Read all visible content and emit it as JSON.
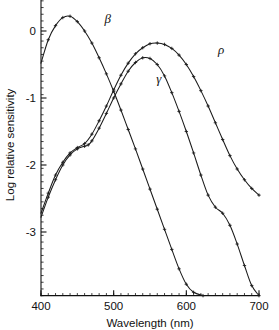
{
  "chart_data": {
    "type": "line",
    "title": "",
    "xlabel": "Wavelength  (nm)",
    "ylabel": "Log relative sensitivity",
    "xlim": [
      400,
      700
    ],
    "ylim": [
      -3.95,
      0.55
    ],
    "xticks": [
      400,
      500,
      600,
      700
    ],
    "xtick_labels": [
      "400",
      "500",
      "600",
      "700"
    ],
    "yticks": [
      0,
      -1,
      -2,
      -3
    ],
    "ytick_labels": [
      "0",
      "-1",
      "-2",
      "-3"
    ],
    "x_minor_tick_step": 10,
    "y_minor_tick_step": 0.1,
    "grid": false,
    "legend": "inline-curve-labels",
    "marker": "plus",
    "series": [
      {
        "name": "beta",
        "label": "β",
        "label_x": 492,
        "label_y": 0.12,
        "points": [
          [
            400,
            -0.48
          ],
          [
            410,
            -0.13
          ],
          [
            420,
            0.08
          ],
          [
            430,
            0.2
          ],
          [
            440,
            0.22
          ],
          [
            450,
            0.14
          ],
          [
            460,
            0.0
          ],
          [
            470,
            -0.18
          ],
          [
            480,
            -0.4
          ],
          [
            490,
            -0.64
          ],
          [
            500,
            -0.9
          ],
          [
            510,
            -1.18
          ],
          [
            520,
            -1.47
          ],
          [
            530,
            -1.76
          ],
          [
            540,
            -2.06
          ],
          [
            550,
            -2.36
          ],
          [
            560,
            -2.66
          ],
          [
            570,
            -2.96
          ],
          [
            580,
            -3.26
          ],
          [
            590,
            -3.55
          ],
          [
            600,
            -3.78
          ],
          [
            610,
            -3.9
          ],
          [
            623,
            -3.95
          ]
        ]
      },
      {
        "name": "gamma",
        "label": "γ",
        "label_x": 562,
        "label_y": -0.78,
        "points": [
          [
            400,
            -2.78
          ],
          [
            410,
            -2.48
          ],
          [
            420,
            -2.22
          ],
          [
            430,
            -2.0
          ],
          [
            440,
            -1.85
          ],
          [
            450,
            -1.76
          ],
          [
            460,
            -1.72
          ],
          [
            465,
            -1.7
          ],
          [
            470,
            -1.64
          ],
          [
            480,
            -1.45
          ],
          [
            490,
            -1.23
          ],
          [
            500,
            -1.0
          ],
          [
            510,
            -0.79
          ],
          [
            520,
            -0.6
          ],
          [
            530,
            -0.47
          ],
          [
            540,
            -0.4
          ],
          [
            550,
            -0.41
          ],
          [
            560,
            -0.5
          ],
          [
            570,
            -0.67
          ],
          [
            580,
            -0.92
          ],
          [
            590,
            -1.2
          ],
          [
            600,
            -1.5
          ],
          [
            610,
            -1.82
          ],
          [
            620,
            -2.15
          ],
          [
            630,
            -2.45
          ],
          [
            640,
            -2.63
          ],
          [
            650,
            -2.72
          ],
          [
            660,
            -2.9
          ],
          [
            670,
            -3.18
          ],
          [
            680,
            -3.5
          ],
          [
            690,
            -3.8
          ],
          [
            700,
            -3.95
          ]
        ]
      },
      {
        "name": "rho",
        "label": "ρ",
        "label_x": 648,
        "label_y": -0.35,
        "points": [
          [
            400,
            -2.72
          ],
          [
            410,
            -2.42
          ],
          [
            420,
            -2.15
          ],
          [
            430,
            -1.96
          ],
          [
            440,
            -1.82
          ],
          [
            450,
            -1.74
          ],
          [
            460,
            -1.68
          ],
          [
            470,
            -1.54
          ],
          [
            480,
            -1.34
          ],
          [
            490,
            -1.12
          ],
          [
            500,
            -0.88
          ],
          [
            510,
            -0.66
          ],
          [
            520,
            -0.48
          ],
          [
            530,
            -0.34
          ],
          [
            540,
            -0.25
          ],
          [
            550,
            -0.19
          ],
          [
            560,
            -0.18
          ],
          [
            570,
            -0.2
          ],
          [
            580,
            -0.26
          ],
          [
            590,
            -0.36
          ],
          [
            600,
            -0.5
          ],
          [
            610,
            -0.68
          ],
          [
            620,
            -0.89
          ],
          [
            630,
            -1.12
          ],
          [
            640,
            -1.37
          ],
          [
            650,
            -1.62
          ],
          [
            660,
            -1.86
          ],
          [
            670,
            -2.06
          ],
          [
            680,
            -2.22
          ],
          [
            690,
            -2.35
          ],
          [
            700,
            -2.45
          ]
        ]
      }
    ]
  },
  "axes": {
    "x_title": "Wavelength  (nm)",
    "y_title": "Log relative sensitivity"
  }
}
